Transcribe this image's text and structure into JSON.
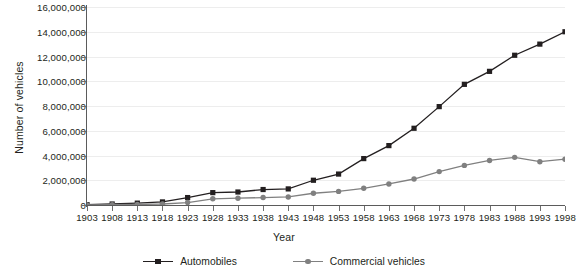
{
  "chart_data": {
    "type": "line",
    "title": "",
    "xlabel": "Year",
    "ylabel": "Number of vehicles",
    "grid": true,
    "legend_position": "bottom",
    "xlim": [
      1903,
      1998
    ],
    "ylim": [
      0,
      16000000
    ],
    "ytick_step": 2000000,
    "ytick_labels": [
      "16,000,000",
      "14,000,000",
      "12,000,000",
      "10,000,000",
      "8,000,000",
      "6,000,000",
      "4,000,000",
      "2,000,000",
      "0"
    ],
    "ytick_values": [
      16000000,
      14000000,
      12000000,
      10000000,
      8000000,
      6000000,
      4000000,
      2000000,
      0
    ],
    "categories": [
      "1903",
      "1908",
      "1913",
      "1918",
      "1923",
      "1928",
      "1933",
      "1938",
      "1943",
      "1948",
      "1953",
      "1958",
      "1963",
      "1968",
      "1973",
      "1978",
      "1983",
      "1988",
      "1993",
      "1998"
    ],
    "x": [
      1903,
      1908,
      1913,
      1918,
      1923,
      1928,
      1933,
      1938,
      1943,
      1948,
      1953,
      1958,
      1963,
      1968,
      1973,
      1978,
      1983,
      1988,
      1993,
      1998
    ],
    "series": [
      {
        "name": "Automobiles",
        "color": "#231f20",
        "marker": "square",
        "values": [
          30000,
          80000,
          150000,
          250000,
          600000,
          1000000,
          1050000,
          1250000,
          1300000,
          2000000,
          2500000,
          3750000,
          4800000,
          6200000,
          7950000,
          9750000,
          10800000,
          12100000,
          13000000,
          14000000
        ]
      },
      {
        "name": "Commercial vehicles",
        "color": "#808080",
        "marker": "circle",
        "values": [
          10000,
          20000,
          40000,
          80000,
          200000,
          500000,
          550000,
          600000,
          650000,
          950000,
          1100000,
          1350000,
          1700000,
          2100000,
          2700000,
          3200000,
          3600000,
          3850000,
          3500000,
          3700000
        ]
      }
    ]
  },
  "legend": {
    "items": [
      {
        "label": "Automobiles"
      },
      {
        "label": "Commercial vehicles"
      }
    ]
  }
}
